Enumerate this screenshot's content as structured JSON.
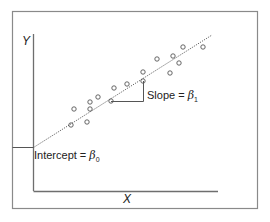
{
  "chart_data": {
    "type": "scatter",
    "title": "",
    "xlabel": "X",
    "ylabel": "Y",
    "grid": false,
    "legend": null,
    "points_px": [
      [
        71,
        125
      ],
      [
        87,
        122
      ],
      [
        74,
        109
      ],
      [
        90,
        109
      ],
      [
        90,
        102
      ],
      [
        98,
        97
      ],
      [
        111,
        101
      ],
      [
        114,
        88
      ],
      [
        127,
        84
      ],
      [
        143,
        81
      ],
      [
        143,
        72
      ],
      [
        157,
        59
      ],
      [
        170,
        73
      ],
      [
        179,
        63
      ],
      [
        173,
        56
      ],
      [
        183,
        47
      ],
      [
        203,
        47
      ]
    ],
    "regression_line": {
      "from": [
        33,
        147
      ],
      "to": [
        212,
        35
      ],
      "style": "dotted"
    },
    "annotations": {
      "slope": {
        "text_main": "Slope = ",
        "symbol": "β",
        "subscript": "1"
      },
      "intercept": {
        "text_main": "Intercept = ",
        "symbol": "β",
        "subscript": "0"
      }
    }
  },
  "labels": {
    "x_axis": "X",
    "y_axis": "Y",
    "slope_prefix": "Slope = ",
    "slope_symbol": "β",
    "slope_sub": "1",
    "intercept_prefix": "Intercept = ",
    "intercept_symbol": "β",
    "intercept_sub": "0"
  },
  "colors": {
    "frame": "#8a8a8a",
    "axis": "#707070",
    "points": "#555555",
    "line": "#555555"
  }
}
